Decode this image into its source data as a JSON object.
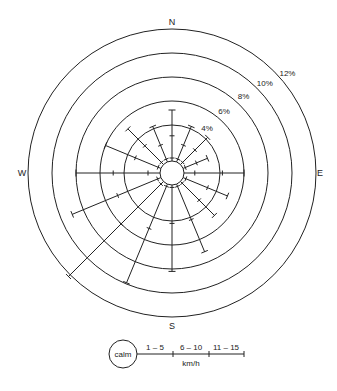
{
  "chart_data": {
    "type": "wind-rose",
    "title": "",
    "units": "%",
    "center": [
      172,
      173
    ],
    "px_per_percent": 12,
    "calm_radius_percent": 1,
    "rings": [
      {
        "value": 4,
        "label": "4%"
      },
      {
        "value": 6,
        "label": "6%"
      },
      {
        "value": 8,
        "label": "8%"
      },
      {
        "value": 10,
        "label": "10%"
      },
      {
        "value": 12,
        "label": "12%"
      }
    ],
    "cardinal_labels": {
      "N": "N",
      "E": "E",
      "S": "S",
      "W": "W"
    },
    "speed_classes": [
      "1 – 5",
      "6 – 10",
      "11 – 15"
    ],
    "speed_unit": "km/h",
    "calm_label": "calm",
    "directions": [
      {
        "dir": "N",
        "angle": 0,
        "cumulative": [
          1.25,
          3.1,
          5.25
        ]
      },
      {
        "dir": "NNE",
        "angle": 22.5,
        "cumulative": [
          1.25,
          2.5,
          4.2
        ]
      },
      {
        "dir": "NE",
        "angle": 45,
        "cumulative": [
          1.25,
          2.7,
          4.2
        ]
      },
      {
        "dir": "ENE",
        "angle": 67.5,
        "cumulative": [
          1.2,
          2.2,
          3.2
        ]
      },
      {
        "dir": "E",
        "angle": 90,
        "cumulative": [
          1.9,
          4.2,
          6.0
        ]
      },
      {
        "dir": "ESE",
        "angle": 112.5,
        "cumulative": [
          1.25,
          3.2,
          5.0
        ]
      },
      {
        "dir": "SE",
        "angle": 135,
        "cumulative": [
          1.2,
          3.2,
          5.0
        ]
      },
      {
        "dir": "SSE",
        "angle": 157.5,
        "cumulative": [
          1.2,
          4.2,
          7.1
        ]
      },
      {
        "dir": "S",
        "angle": 180,
        "cumulative": [
          1.2,
          4.2,
          8.2
        ]
      },
      {
        "dir": "SSW",
        "angle": 202.5,
        "cumulative": [
          1.2,
          5.0,
          9.9
        ]
      },
      {
        "dir": "SW",
        "angle": 225,
        "cumulative": [
          1.3,
          6.0,
          12.2
        ]
      },
      {
        "dir": "WSW",
        "angle": 247.5,
        "cumulative": [
          1.3,
          4.9,
          9.0
        ]
      },
      {
        "dir": "W",
        "angle": 270,
        "cumulative": [
          2.0,
          4.9,
          8.0
        ]
      },
      {
        "dir": "WNW",
        "angle": 292.5,
        "cumulative": [
          1.25,
          3.3,
          6.0
        ]
      },
      {
        "dir": "NW",
        "angle": 315,
        "cumulative": [
          1.25,
          3.2,
          5.2
        ]
      },
      {
        "dir": "NNW",
        "angle": 337.5,
        "cumulative": [
          1.25,
          2.5,
          4.2
        ]
      }
    ],
    "grid": true,
    "legend_position": "bottom"
  },
  "legend": {
    "calm": "calm",
    "classes": [
      "1 – 5",
      "6 – 10",
      "11 – 15"
    ],
    "unit": "km/h"
  },
  "labels": {
    "N": "N",
    "E": "E",
    "S": "S",
    "W": "W"
  }
}
